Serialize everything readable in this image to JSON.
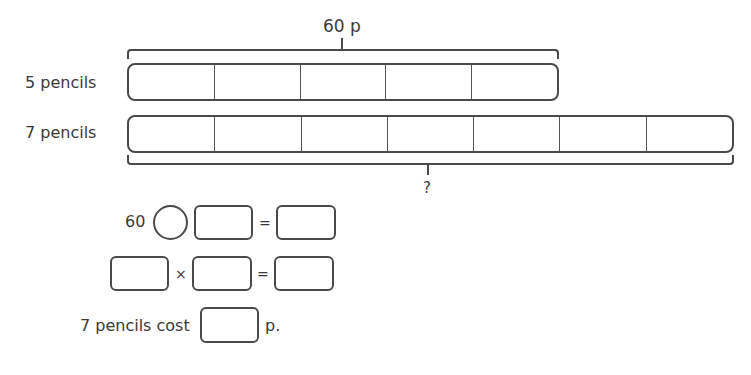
{
  "diagram": {
    "top_bracket_label": "60 p",
    "bottom_bracket_label": "?",
    "bars": [
      {
        "label": "5 pencils",
        "cells": 5
      },
      {
        "label": "7 pencils",
        "cells": 7
      }
    ]
  },
  "equations": {
    "row1": {
      "number": "60",
      "operator_symbol": "",
      "box1": "",
      "equals": "=",
      "result": ""
    },
    "row2": {
      "box1": "",
      "times": "×",
      "box2": "",
      "equals": "=",
      "result": ""
    },
    "row3": {
      "prefix": "7 pencils cost",
      "answer": "",
      "suffix": "p."
    }
  },
  "colors": {
    "stroke": "#4a4a4a",
    "text": "#3a3a3a",
    "background": "#ffffff"
  }
}
